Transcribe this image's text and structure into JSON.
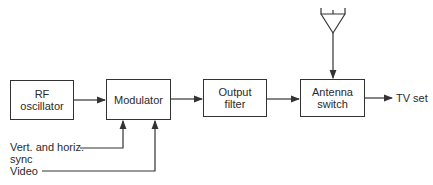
{
  "diagram": {
    "title": "",
    "blocks": [
      {
        "id": "rf_oscillator",
        "label": "RF\noscillator"
      },
      {
        "id": "modulator",
        "label": "Modulator"
      },
      {
        "id": "output_filter",
        "label": "Output\nfilter"
      },
      {
        "id": "antenna_switch",
        "label": "Antenna\nswitch"
      }
    ],
    "inputs": {
      "sync": "Vert. and horiz.\nsync",
      "video": "Video"
    },
    "output": "TV set",
    "antenna": "antenna-symbol",
    "connections": [
      [
        "rf_oscillator",
        "modulator"
      ],
      [
        "modulator",
        "output_filter"
      ],
      [
        "output_filter",
        "antenna_switch"
      ],
      [
        "antenna",
        "antenna_switch"
      ],
      [
        "sync",
        "modulator"
      ],
      [
        "video",
        "modulator"
      ],
      [
        "antenna_switch",
        "TV set"
      ]
    ]
  },
  "colors": {
    "line": "#333333",
    "background": "#ffffff"
  }
}
